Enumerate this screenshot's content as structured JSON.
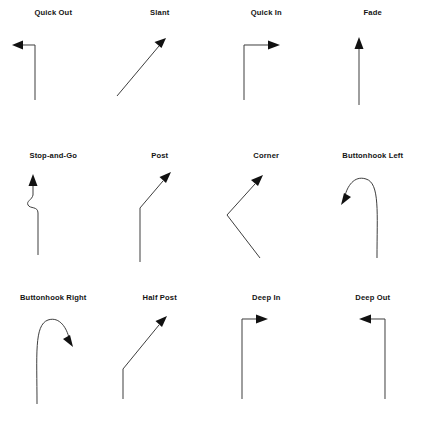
{
  "figure": {
    "background_color": "#ffffff",
    "stroke_color": "#3d3d3d",
    "arrowhead_color": "#111111",
    "label_color": "#141414",
    "columns": 4,
    "rows": 3
  },
  "routes": [
    {
      "label": "Quick Out",
      "row": 1,
      "column": 1,
      "shape": "vertical-then-left",
      "direction": "left"
    },
    {
      "label": "Slant",
      "row": 1,
      "column": 2,
      "shape": "diagonal-up-right",
      "direction": "up-right"
    },
    {
      "label": "Quick In",
      "row": 1,
      "column": 3,
      "shape": "vertical-then-right",
      "direction": "right"
    },
    {
      "label": "Fade",
      "row": 1,
      "column": 4,
      "shape": "vertical-straight",
      "direction": "up"
    },
    {
      "label": "Stop-and-Go",
      "row": 2,
      "column": 1,
      "shape": "vertical-with-hitch-then-up",
      "direction": "up"
    },
    {
      "label": "Post",
      "row": 2,
      "column": 2,
      "shape": "vertical-then-diagonal-up-right",
      "direction": "up-right"
    },
    {
      "label": "Corner",
      "row": 2,
      "column": 3,
      "shape": "chevron-up-left-then-up-right",
      "direction": "up-right"
    },
    {
      "label": "Buttonhook Left",
      "row": 2,
      "column": 4,
      "shape": "vertical-then-hook-left",
      "direction": "down-left"
    },
    {
      "label": "Buttonhook Right",
      "row": 3,
      "column": 1,
      "shape": "vertical-then-hook-right",
      "direction": "down-right"
    },
    {
      "label": "Half Post",
      "row": 3,
      "column": 2,
      "shape": "short-vertical-then-long-diagonal",
      "direction": "up-right"
    },
    {
      "label": "Deep In",
      "row": 3,
      "column": 3,
      "shape": "long-vertical-then-right",
      "direction": "right"
    },
    {
      "label": "Deep Out",
      "row": 3,
      "column": 4,
      "shape": "long-vertical-then-left",
      "direction": "left"
    }
  ]
}
